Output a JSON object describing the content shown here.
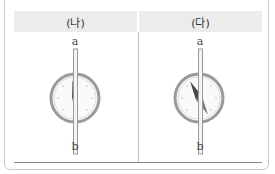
{
  "table": {
    "headers": [
      "(나)",
      "(다)"
    ],
    "header_bg": "#ececec"
  },
  "figures": [
    {
      "id": "na",
      "top_label": "a",
      "bottom_label": "b",
      "needle": {
        "angle_deg": 8,
        "dark_end": "top",
        "dark_color": "#4a4a4a",
        "light_color": "#8a8a8a"
      }
    },
    {
      "id": "da",
      "top_label": "a",
      "bottom_label": "b",
      "needle": {
        "angle_deg": -28,
        "dark_end": "top",
        "dark_color": "#4a4a4a",
        "light_color": "#8a8a8a"
      }
    }
  ]
}
